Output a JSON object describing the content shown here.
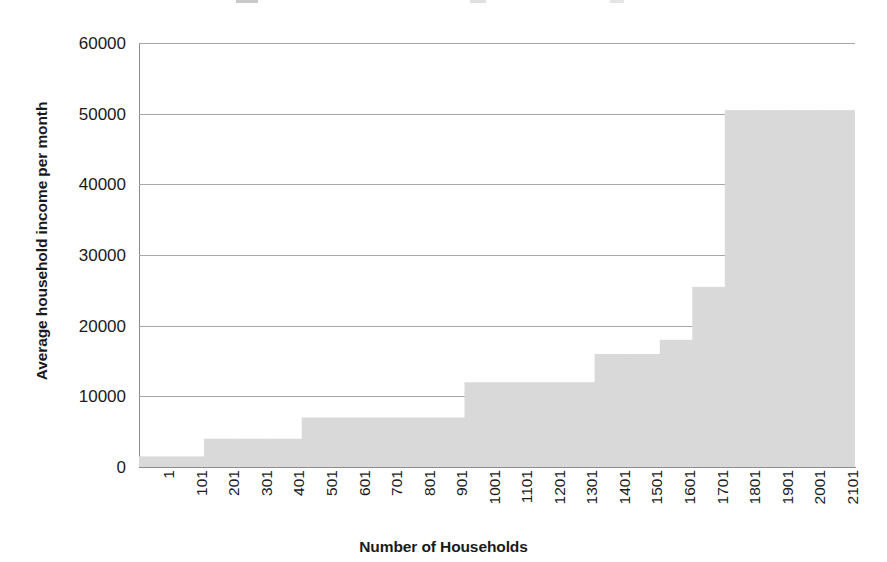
{
  "chart_data": {
    "type": "bar",
    "title": "",
    "xlabel": "Number of Households",
    "ylabel": "Average household income per month",
    "xlim": [
      1,
      2201
    ],
    "ylim": [
      0,
      60000
    ],
    "grid": true,
    "legend": false,
    "bar_color": "#d9d9d9",
    "categories": [
      "1",
      "101",
      "201",
      "301",
      "401",
      "501",
      "601",
      "701",
      "801",
      "901",
      "1001",
      "1101",
      "1201",
      "1301",
      "1401",
      "1501",
      "1601",
      "1701",
      "1801",
      "1901",
      "2001",
      "2101"
    ],
    "values": [
      1500,
      1500,
      4000,
      4000,
      4000,
      7000,
      7000,
      7000,
      7000,
      7000,
      12000,
      12000,
      12000,
      12000,
      16000,
      16000,
      18000,
      25500,
      50500,
      50500,
      50500,
      50500
    ],
    "steps": [
      {
        "x_start": "1",
        "x_end": "201",
        "value": 1500
      },
      {
        "x_start": "201",
        "x_end": "551",
        "value": 4000
      },
      {
        "x_start": "551",
        "x_end": "1001",
        "value": 7000
      },
      {
        "x_start": "1001",
        "x_end": "1401",
        "value": 12000
      },
      {
        "x_start": "1401",
        "x_end": "1601",
        "value": 16000
      },
      {
        "x_start": "1601",
        "x_end": "1701",
        "value": 18000
      },
      {
        "x_start": "1701",
        "x_end": "1801",
        "value": 25500
      },
      {
        "x_start": "1801",
        "x_end": "2201",
        "value": 50500
      }
    ],
    "y_ticks": [
      0,
      10000,
      20000,
      30000,
      40000,
      50000,
      60000
    ],
    "y_tick_labels": [
      "0",
      "10000",
      "20000",
      "30000",
      "40000",
      "50000",
      "60000"
    ]
  }
}
